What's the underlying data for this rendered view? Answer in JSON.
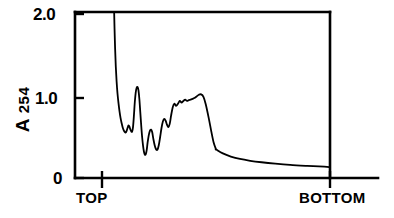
{
  "chart_data": {
    "type": "line",
    "title": "",
    "subtitle": "",
    "xlabel": "",
    "ylabel": "A 254",
    "ylabel_main": "A",
    "ylabel_subscript": "254",
    "grid": false,
    "legend": null,
    "legend_position": "none",
    "xlim": [
      0,
      1
    ],
    "ylim": [
      0,
      2.05
    ],
    "yticks": [
      0,
      1.0,
      2.0
    ],
    "ytick_labels": [
      "0",
      "1.0",
      "2.0"
    ],
    "xticks": [
      0,
      1
    ],
    "xtick_labels": [
      "TOP",
      "BOTTOM"
    ],
    "x_axis_direction": "top-to-bottom gradient fraction",
    "line_color": "#000000",
    "line_width": 1.8,
    "series": [
      {
        "name": "A254 absorbance trace",
        "note": "trace is clipped by the top border; values above 2.05 are off scale",
        "x": [
          0.105,
          0.107,
          0.11,
          0.115,
          0.121,
          0.128,
          0.136,
          0.145,
          0.154,
          0.163,
          0.172,
          0.181,
          0.19,
          0.199,
          0.208,
          0.216,
          0.224,
          0.232,
          0.24,
          0.248,
          0.256,
          0.264,
          0.272,
          0.28,
          0.288,
          0.296,
          0.304,
          0.312,
          0.32,
          0.328,
          0.336,
          0.344,
          0.352,
          0.36,
          0.368,
          0.376,
          0.384,
          0.392,
          0.4,
          0.41,
          0.42,
          0.43,
          0.44,
          0.45,
          0.462,
          0.474,
          0.486,
          0.498,
          0.51,
          0.522,
          0.534,
          0.546,
          0.558,
          0.57,
          0.582,
          0.594,
          0.606,
          0.62,
          0.634,
          0.65,
          0.666,
          0.682,
          0.698,
          0.714,
          0.73,
          0.746,
          0.762,
          0.778,
          0.794,
          0.81,
          0.83,
          0.85,
          0.87,
          0.89,
          0.91,
          0.935,
          0.96,
          0.98,
          1.0
        ],
        "y": [
          2.05,
          2.0,
          1.82,
          1.58,
          1.36,
          1.18,
          1.03,
          0.91,
          0.81,
          0.73,
          0.67,
          0.62,
          0.585,
          0.562,
          0.555,
          0.575,
          0.61,
          0.64,
          0.628,
          0.596,
          0.57,
          0.565,
          0.62,
          0.76,
          0.93,
          1.045,
          1.1,
          1.11,
          1.07,
          0.96,
          0.8,
          0.64,
          0.5,
          0.395,
          0.32,
          0.285,
          0.29,
          0.34,
          0.43,
          0.52,
          0.575,
          0.59,
          0.56,
          0.48,
          0.4,
          0.35,
          0.345,
          0.4,
          0.5,
          0.61,
          0.69,
          0.72,
          0.7,
          0.65,
          0.62,
          0.66,
          0.76,
          0.86,
          0.905,
          0.88,
          0.905,
          0.94,
          0.92,
          0.94,
          0.955,
          0.94,
          0.95,
          0.955,
          0.965,
          0.975,
          0.995,
          1.015,
          1.02,
          0.99,
          0.9,
          0.74,
          0.56,
          0.43,
          0.35
        ]
      },
      {
        "name": "A254 tail",
        "x": [
          1.0,
          1.06,
          1.13,
          1.21,
          1.3,
          1.4,
          1.52,
          1.65,
          1.8,
          1.95,
          2.0
        ],
        "y": [
          0.35,
          0.3,
          0.262,
          0.232,
          0.21,
          0.192,
          0.175,
          0.16,
          0.148,
          0.138,
          0.132
        ]
      }
    ]
  },
  "axes": {
    "y_tick_2": "2.0",
    "y_tick_1": "1.0",
    "y_tick_0": "0",
    "x_tick_left": "TOP",
    "x_tick_right": "BOTTOM",
    "y_axis_title_main": "A",
    "y_axis_title_sub": "254"
  },
  "style": {
    "background": "#ffffff",
    "ink": "#000000"
  }
}
